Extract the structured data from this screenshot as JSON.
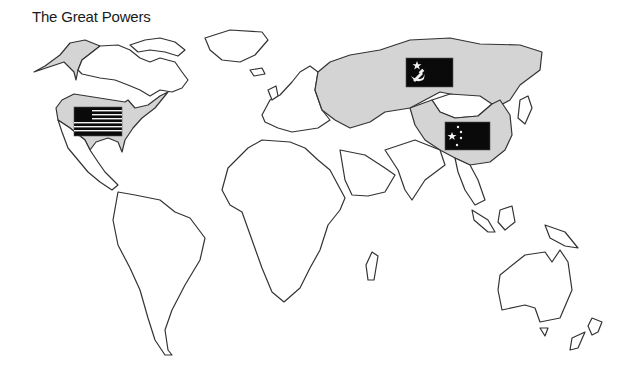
{
  "title": "The Great Powers",
  "legend": {
    "powers": [
      {
        "name": "United States",
        "flag": "us-flag-icon",
        "color": "#d4d4d4"
      },
      {
        "name": "Soviet Union",
        "flag": "ussr-flag-icon",
        "color": "#d4d4d4"
      },
      {
        "name": "China",
        "flag": "china-flag-icon",
        "color": "#d4d4d4"
      }
    ]
  },
  "colors": {
    "highlight_fill": "#d4d4d4",
    "land_fill": "#ffffff",
    "outline": "#333333",
    "flag": "#0a0a0a"
  }
}
